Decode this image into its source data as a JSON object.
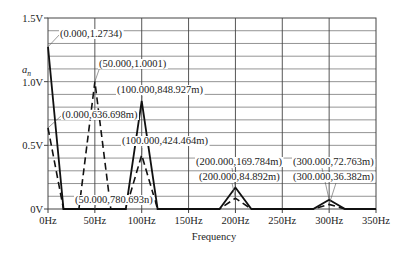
{
  "chart_data": {
    "type": "line",
    "title": "",
    "xlabel": "Frequency",
    "ylabel": "a_n",
    "xlim": [
      0,
      350
    ],
    "ylim": [
      0,
      1.5
    ],
    "grid": true,
    "x_ticks": [
      "0Hz",
      "50Hz",
      "100Hz",
      "150Hz",
      "200Hz",
      "250Hz",
      "300Hz",
      "350Hz"
    ],
    "y_ticks": [
      "0V",
      "0.5V",
      "1.0V",
      "1.5V"
    ],
    "series": [
      {
        "name": "solid",
        "style": "solid",
        "x": [
          0,
          16.5,
          83,
          100,
          117,
          183,
          200,
          217,
          283,
          300,
          317,
          350
        ],
        "values": [
          1.2734,
          0,
          0,
          0.848927,
          0,
          0,
          0.169784,
          0,
          0,
          0.072763,
          0,
          0
        ]
      },
      {
        "name": "dashed",
        "style": "dashed",
        "x": [
          0,
          16.5,
          33,
          50,
          67,
          83,
          100,
          117,
          183,
          200,
          217,
          283,
          300,
          317
        ],
        "values": [
          0.636698,
          0,
          0,
          1.0001,
          0,
          0,
          0.424464,
          0,
          0,
          0.084892,
          0,
          0,
          0.036382,
          0
        ]
      }
    ],
    "annotations": [
      {
        "text": "(0.000,1.2734)",
        "x": 0,
        "y": 1.2734
      },
      {
        "text": "(50.000,1.0001)",
        "x": 50,
        "y": 1.0001
      },
      {
        "text": "(100.000,848.927m)",
        "x": 100,
        "y": 0.848927
      },
      {
        "text": "(0.000,636.698m)",
        "x": 0,
        "y": 0.636698
      },
      {
        "text": "(100.000,424.464m)",
        "x": 100,
        "y": 0.424464
      },
      {
        "text": "(50.000,780.693n)",
        "x": 50,
        "y": 7.80693e-07
      },
      {
        "text": "(200.000,169.784m)",
        "x": 200,
        "y": 0.169784
      },
      {
        "text": "(200.000,84.892m)",
        "x": 200,
        "y": 0.084892
      },
      {
        "text": "(300.000,72.763m)",
        "x": 300,
        "y": 0.072763
      },
      {
        "text": "(300.000,36.382m)",
        "x": 300,
        "y": 0.036382
      }
    ]
  },
  "labels": {
    "y_axis_symbol": "a",
    "y_axis_subscript": "n",
    "x_axis_title": "Frequency"
  }
}
